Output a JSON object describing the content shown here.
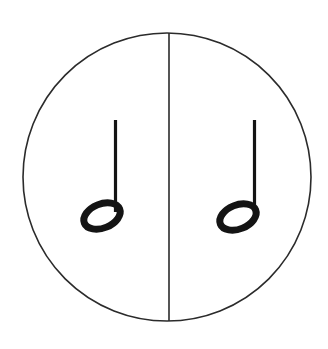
{
  "figure": {
    "title": "Circle divided in half with one half note in each half",
    "caption": "",
    "background_color": "#ffffff",
    "width": 328,
    "height": 349
  },
  "circle": {
    "name": "outer-circle",
    "center_x": 167,
    "center_y": 177,
    "radius": 144,
    "stroke_color": "#2b2b2b",
    "stroke_width": 1.6,
    "fill": "none"
  },
  "divider": {
    "name": "vertical-divider-line",
    "orientation": "vertical",
    "x": 169,
    "y_top": 33,
    "y_bottom": 321,
    "stroke_color": "#2b2b2b",
    "stroke_width": 1.6
  },
  "notes": [
    {
      "id": "left-half-note",
      "label": "half note",
      "duration": "half",
      "notehead": {
        "center_x": 102,
        "center_y": 216,
        "rx": 19,
        "ry": 12,
        "rotation_deg": -22,
        "fill": "none",
        "stroke_color": "#141414",
        "stroke_width": 7
      },
      "stem": {
        "x": 115.5,
        "y_top": 120,
        "y_bottom": 212,
        "direction": "up",
        "stroke_color": "#141414",
        "stroke_width": 3.2
      }
    },
    {
      "id": "right-half-note",
      "label": "half note",
      "duration": "half",
      "notehead": {
        "center_x": 238,
        "center_y": 217,
        "rx": 19,
        "ry": 12,
        "rotation_deg": -22,
        "fill": "none",
        "stroke_color": "#141414",
        "stroke_width": 7
      },
      "stem": {
        "x": 254.5,
        "y_top": 120,
        "y_bottom": 213,
        "direction": "up",
        "stroke_color": "#141414",
        "stroke_width": 3.2
      }
    }
  ]
}
